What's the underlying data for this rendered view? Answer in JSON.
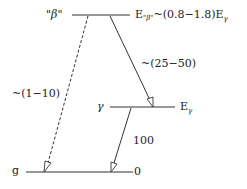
{
  "diagram": {
    "levels": {
      "beta": {
        "label": "\"β\"",
        "energy_prefix": "E",
        "energy_sub": "\"β\"",
        "energy_expr": "~(0.8−1.8)E",
        "energy_expr_sub": "γ"
      },
      "gamma": {
        "label": "γ",
        "energy": "E",
        "energy_sub": "γ"
      },
      "ground": {
        "label": "g",
        "energy": "0"
      }
    },
    "transitions": [
      {
        "from": "beta",
        "to": "ground",
        "label": "~(1−10)",
        "style": "dashed"
      },
      {
        "from": "beta",
        "to": "gamma",
        "label": "~(25−50)",
        "style": "solid"
      },
      {
        "from": "gamma",
        "to": "ground",
        "label": "100",
        "style": "solid"
      }
    ],
    "colors": {
      "line": "#333333",
      "background": "#ffffff"
    }
  }
}
